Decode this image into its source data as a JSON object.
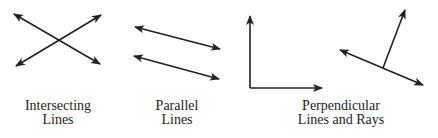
{
  "figure": {
    "stroke_color": "#222222",
    "background": "#ffffff",
    "panels": [
      {
        "id": "intersecting",
        "caption_lines": [
          "Intersecting",
          "Lines"
        ],
        "caption_center_x": 58,
        "segments": [
          {
            "x1": 14,
            "y1": 14,
            "x2": 100,
            "y2": 64,
            "start_arrow": true,
            "end_arrow": true
          },
          {
            "x1": 16,
            "y1": 66,
            "x2": 101,
            "y2": 15,
            "start_arrow": true,
            "end_arrow": true
          }
        ]
      },
      {
        "id": "parallel",
        "caption_lines": [
          "Parallel",
          "Lines"
        ],
        "caption_center_x": 177,
        "segments": [
          {
            "x1": 135,
            "y1": 27,
            "x2": 220,
            "y2": 49,
            "start_arrow": true,
            "end_arrow": true
          },
          {
            "x1": 134,
            "y1": 56,
            "x2": 219,
            "y2": 79,
            "start_arrow": true,
            "end_arrow": true
          }
        ]
      },
      {
        "id": "perpendicular",
        "caption_lines": [
          "Perpendicular",
          "Lines and Rays"
        ],
        "caption_center_x": 341,
        "segments": [
          {
            "x1": 250,
            "y1": 88,
            "x2": 250,
            "y2": 16,
            "start_arrow": false,
            "end_arrow": true
          },
          {
            "x1": 250,
            "y1": 88,
            "x2": 322,
            "y2": 88,
            "start_arrow": false,
            "end_arrow": true
          },
          {
            "x1": 340,
            "y1": 50,
            "x2": 423,
            "y2": 85,
            "start_arrow": true,
            "end_arrow": true
          },
          {
            "x1": 383,
            "y1": 68,
            "x2": 405,
            "y2": 10,
            "start_arrow": false,
            "end_arrow": true
          }
        ]
      }
    ]
  }
}
